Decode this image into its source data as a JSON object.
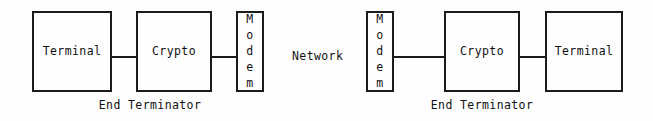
{
  "diagram": {
    "type": "block-diagram",
    "background_color": "#fdfdfd",
    "line_color": "#1b1b1b",
    "text_color": "#111111",
    "network_label": "Network",
    "nodes": [
      {
        "id": "left-terminal",
        "label": "Terminal",
        "orientation": "horizontal",
        "side": "left",
        "x": 32,
        "y": 11,
        "width": 80,
        "height": 81
      },
      {
        "id": "left-crypto",
        "label": "Crypto",
        "orientation": "horizontal",
        "side": "left",
        "x": 136,
        "y": 11,
        "width": 76,
        "height": 81
      },
      {
        "id": "left-modem",
        "label": "Modem",
        "orientation": "vertical",
        "side": "left",
        "x": 236,
        "y": 11,
        "width": 28,
        "height": 81
      },
      {
        "id": "right-modem",
        "label": "Modem",
        "orientation": "vertical",
        "side": "right",
        "x": 366,
        "y": 11,
        "width": 28,
        "height": 81
      },
      {
        "id": "right-crypto",
        "label": "Crypto",
        "orientation": "horizontal",
        "side": "right",
        "x": 444,
        "y": 11,
        "width": 76,
        "height": 81
      },
      {
        "id": "right-terminal",
        "label": "Terminal",
        "orientation": "horizontal",
        "side": "right",
        "x": 545,
        "y": 11,
        "width": 78,
        "height": 81
      }
    ],
    "connectors": [
      {
        "id": "left-terminal-to-crypto",
        "from": "left-terminal",
        "to": "left-crypto",
        "x": 112,
        "y": 56,
        "length": 24
      },
      {
        "id": "left-crypto-to-modem",
        "from": "left-crypto",
        "to": "left-modem",
        "x": 212,
        "y": 56,
        "length": 24
      },
      {
        "id": "right-modem-to-crypto",
        "from": "right-modem",
        "to": "right-crypto",
        "x": 394,
        "y": 56,
        "length": 50
      },
      {
        "id": "right-crypto-to-terminal",
        "from": "right-crypto",
        "to": "right-terminal",
        "x": 520,
        "y": 56,
        "length": 25
      }
    ],
    "groups": [
      {
        "id": "left-group",
        "caption": "End Terminator",
        "center_x": 150,
        "y": 100
      },
      {
        "id": "right-group",
        "caption": "End Terminator",
        "center_x": 482,
        "y": 100
      }
    ],
    "network": {
      "x": 292,
      "y": 51
    }
  }
}
